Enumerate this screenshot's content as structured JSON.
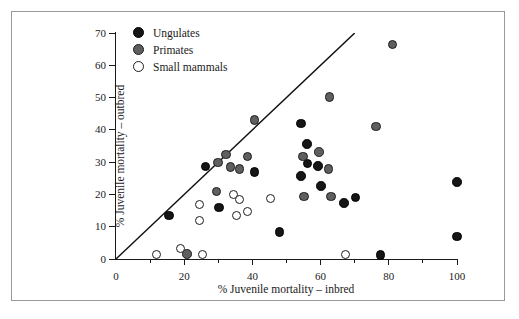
{
  "chart_data": {
    "type": "scatter",
    "title": "",
    "xlabel": "% Juvenile mortality – inbred",
    "ylabel": "% Juvenile mortality – outbred",
    "xlim": [
      0,
      100
    ],
    "ylim": [
      0,
      70
    ],
    "xticks": [
      0,
      20,
      40,
      60,
      80,
      100
    ],
    "yticks": [
      0,
      10,
      20,
      30,
      40,
      50,
      60,
      70
    ],
    "xminorticks": [
      10,
      30,
      50,
      70,
      90
    ],
    "grid": false,
    "legend_position": "top-left",
    "annotations": [
      {
        "type": "line",
        "label": "y = x reference line",
        "from": [
          0,
          0
        ],
        "to": [
          70,
          70
        ]
      }
    ],
    "series": [
      {
        "name": "Ungulates",
        "marker": "filled-circle",
        "color": "#161616",
        "points": [
          [
            15.5,
            13.4
          ],
          [
            26.2,
            28.6
          ],
          [
            30.2,
            15.9
          ],
          [
            40.6,
            27.0
          ],
          [
            48.0,
            8.4
          ],
          [
            54.2,
            42.0
          ],
          [
            54.3,
            25.7
          ],
          [
            56.0,
            35.6
          ],
          [
            56.2,
            29.6
          ],
          [
            59.3,
            28.8
          ],
          [
            60.1,
            22.6
          ],
          [
            66.8,
            17.3
          ],
          [
            70.2,
            19.1
          ],
          [
            77.5,
            1.3
          ],
          [
            100.0,
            23.9
          ],
          [
            100.0,
            7.0
          ]
        ]
      },
      {
        "name": "Primates",
        "marker": "filled-circle",
        "color": "#5f5f5f",
        "points": [
          [
            20.8,
            1.5
          ],
          [
            29.4,
            20.9
          ],
          [
            29.9,
            29.9
          ],
          [
            32.3,
            32.4
          ],
          [
            33.6,
            28.5
          ],
          [
            36.2,
            27.9
          ],
          [
            38.6,
            31.8
          ],
          [
            40.6,
            43.1
          ],
          [
            54.9,
            31.7
          ],
          [
            55.1,
            19.4
          ],
          [
            59.6,
            33.1
          ],
          [
            62.3,
            27.9
          ],
          [
            62.6,
            50.2
          ],
          [
            63.0,
            19.3
          ],
          [
            76.2,
            41.0
          ],
          [
            81.1,
            66.5
          ]
        ]
      },
      {
        "name": "Small mammals",
        "marker": "open-circle",
        "color": "#ffffff",
        "points": [
          [
            11.8,
            1.5
          ],
          [
            18.8,
            3.1
          ],
          [
            24.5,
            16.9
          ],
          [
            24.6,
            11.8
          ],
          [
            25.3,
            1.5
          ],
          [
            34.4,
            19.9
          ],
          [
            35.2,
            13.6
          ],
          [
            36.1,
            18.3
          ],
          [
            38.6,
            14.6
          ],
          [
            45.3,
            18.6
          ],
          [
            67.3,
            1.5
          ]
        ]
      }
    ]
  },
  "legend": {
    "items": [
      {
        "label": "Ungulates",
        "marker_class": "ungulate"
      },
      {
        "label": "Primates",
        "marker_class": "primate"
      },
      {
        "label": "Small mammals",
        "marker_class": "small"
      }
    ]
  }
}
